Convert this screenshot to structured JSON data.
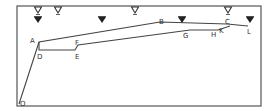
{
  "diagram": {
    "frame": {
      "x": 17,
      "y": 6,
      "width": 244,
      "height": 100,
      "stroke": "#555555"
    },
    "line_color": "#444444",
    "points": {
      "O": {
        "x": 19,
        "y": 104,
        "label": "O",
        "lx": 20,
        "ly": 106
      },
      "A": {
        "x": 39,
        "y": 42,
        "label": "A",
        "lx": 30,
        "ly": 43
      },
      "D": {
        "x": 39,
        "y": 50,
        "label": "D",
        "lx": 37,
        "ly": 59
      },
      "E": {
        "x": 75,
        "y": 50,
        "label": "E",
        "lx": 75,
        "ly": 59
      },
      "F": {
        "x": 78,
        "y": 45,
        "label": "F",
        "lx": 75,
        "ly": 45
      },
      "B": {
        "x": 160,
        "y": 22,
        "label": "B",
        "lx": 159,
        "ly": 24
      },
      "G": {
        "x": 190,
        "y": 30,
        "label": "G",
        "lx": 183,
        "ly": 38
      },
      "H": {
        "x": 218,
        "y": 30,
        "label": "H",
        "lx": 211,
        "ly": 37
      },
      "C": {
        "x": 227,
        "y": 24,
        "label": "C",
        "lx": 225,
        "ly": 24
      },
      "K": {
        "x": 230,
        "y": 26,
        "label": "K",
        "lx": 219,
        "ly": 33
      },
      "L": {
        "x": 248,
        "y": 26,
        "label": "L",
        "lx": 247,
        "ly": 34
      }
    },
    "upper_path": [
      "O",
      "A",
      "B",
      "C",
      "L"
    ],
    "lower_path": [
      "A",
      "D",
      "E",
      "F",
      "G",
      "H",
      "K"
    ],
    "open_triangles": [
      {
        "x": 38,
        "y": 10
      },
      {
        "x": 58,
        "y": 10
      },
      {
        "x": 135,
        "y": 10
      },
      {
        "x": 228,
        "y": 10
      }
    ],
    "filled_triangles": [
      {
        "x": 38,
        "y": 20
      },
      {
        "x": 102,
        "y": 20
      },
      {
        "x": 182,
        "y": 20
      },
      {
        "x": 250,
        "y": 20
      }
    ],
    "labels": [
      "A",
      "B",
      "C",
      "D",
      "E",
      "F",
      "G",
      "H",
      "K",
      "L",
      "O"
    ]
  }
}
